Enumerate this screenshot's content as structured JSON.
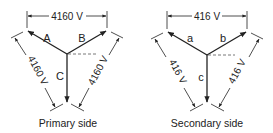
{
  "diagram": {
    "type": "wye-phasor-diagram",
    "colors": {
      "line": "#222222",
      "dashed": "#555555",
      "background": "#ffffff"
    },
    "primary": {
      "caption": "Primary side",
      "phases": [
        {
          "label": "A"
        },
        {
          "label": "B"
        },
        {
          "label": "C"
        }
      ],
      "line_voltage_top": "4160 V",
      "line_voltage_left": "4160 V",
      "line_voltage_right": "4160 V"
    },
    "secondary": {
      "caption": "Secondary side",
      "phases": [
        {
          "label": "a"
        },
        {
          "label": "b"
        },
        {
          "label": "c"
        }
      ],
      "line_voltage_top": "416 V",
      "line_voltage_left": "416 V",
      "line_voltage_right": "416 V"
    }
  }
}
